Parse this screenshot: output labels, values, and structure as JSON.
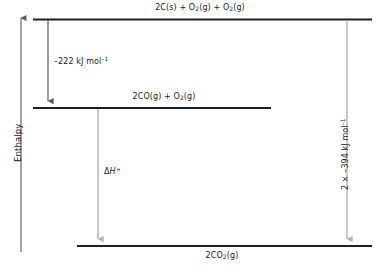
{
  "figure": {
    "type": "enthalpy-level-diagram",
    "axis": {
      "label": "Enthalpy",
      "direction": "up",
      "ticks": []
    },
    "levels": [
      {
        "id": "reactants",
        "label_html": "2C(s) + O<sub>2</sub>(g) + O<sub>2</sub>(g)",
        "label_text": "2C(s) + O2(g) + O2(g)",
        "position": "top"
      },
      {
        "id": "intermediate",
        "label_html": "2CO(g) + O<sub>2</sub>(g)",
        "label_text": "2CO(g) + O2(g)",
        "position": "middle"
      },
      {
        "id": "products",
        "label_html": "2CO<sub>2</sub>(g)",
        "label_text": "2CO2(g)",
        "position": "bottom"
      }
    ],
    "arrows": [
      {
        "id": "step-one",
        "from": "reactants",
        "to": "intermediate",
        "label_html": "–222 kJ mol<sup>–1</sup>",
        "label_text": "-222 kJ mol-1",
        "color": "#58595b"
      },
      {
        "id": "overall",
        "from": "intermediate",
        "to": "products",
        "label_html": "Δ<i>H</i><sup>⦵</sup>",
        "label_text": "ΔH⦵",
        "color": "#b3b3b3"
      },
      {
        "id": "formation",
        "from": "reactants",
        "to": "products",
        "label_html": "2 × –394 kJ mol<sup>–1</sup>",
        "label_text": "2 x -394 kJ mol-1",
        "color": "#9d9fa2"
      }
    ],
    "colors": {
      "level_line": "#231f20",
      "axis_line": "#58595b",
      "text": "#231f20",
      "arrow_dark": "#58595b",
      "arrow_light": "#b3b3b3",
      "background": "#ffffff"
    }
  },
  "chart_data": {
    "type": "line",
    "title": "",
    "xlabel": "",
    "ylabel": "Enthalpy",
    "grid": false,
    "legend": "none",
    "categories": [
      "2C(s) + O2(g) + O2(g)",
      "2CO(g) + O2(g)",
      "2CO2(g)"
    ],
    "values": [
      0,
      -222,
      -788
    ],
    "annotations": [
      {
        "text": "-222 kJ mol-1",
        "between": [
          "2C(s) + O2(g) + O2(g)",
          "2CO(g) + O2(g)"
        ]
      },
      {
        "text": "ΔH⦵",
        "between": [
          "2CO(g) + O2(g)",
          "2CO2(g)"
        ]
      },
      {
        "text": "2 x -394 kJ mol-1",
        "between": [
          "2C(s) + O2(g) + O2(g)",
          "2CO2(g)"
        ]
      }
    ]
  }
}
